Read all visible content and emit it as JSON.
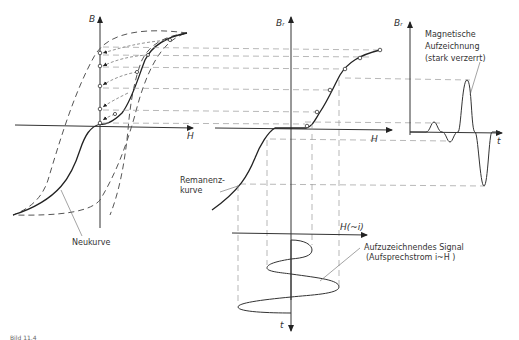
{
  "figure": {
    "caption_fragment": "Bild 11.4",
    "panels": {
      "hysteresis": {
        "y_axis_label": "B",
        "x_axis_label": "H",
        "curve_label": "Neukurve"
      },
      "remanence": {
        "y_axis_label": "Bᵣ",
        "x_axis_label": "H",
        "curve_label_line1": "Remanenz-",
        "curve_label_line2": "kurve"
      },
      "signal": {
        "x_axis_label": "H(~i)",
        "t_axis_label": "t",
        "label_line1": "Aufzuzeichnendes   Signal",
        "label_line2": "(Aufsprechstrom   i~H )"
      },
      "recording": {
        "y_axis_label": "Bᵣ",
        "t_axis_label": "t",
        "label_line1": "Magnetische",
        "label_line2": "Aufzeichnung",
        "label_line3": "(stark  verzerrt)"
      }
    },
    "colors": {
      "line": "#2a2a2a",
      "dashed": "#8a8a8a",
      "background": "#ffffff"
    }
  }
}
